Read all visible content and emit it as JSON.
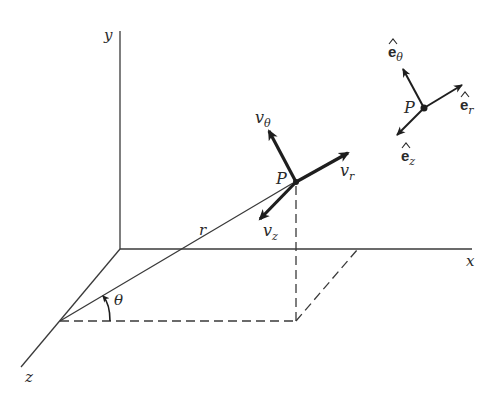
{
  "diagram": {
    "axes": {
      "x_label": "x",
      "y_label": "y",
      "z_label": "z"
    },
    "point_label": "P",
    "radius_label": "r",
    "angle_label": "θ",
    "velocity_components": {
      "v_theta": {
        "base": "v",
        "sub": "θ"
      },
      "v_r": {
        "base": "v",
        "sub": "r"
      },
      "v_z": {
        "base": "v",
        "sub": "z"
      }
    },
    "unit_vectors": {
      "point_label": "P",
      "e_theta": {
        "base": "e",
        "sub": "θ"
      },
      "e_r": {
        "base": "e",
        "sub": "r"
      },
      "e_z": {
        "base": "e",
        "sub": "z"
      }
    },
    "colors": {
      "line": "#3a3a3a",
      "arrow": "#1e1e1e",
      "background": "#ffffff"
    }
  }
}
